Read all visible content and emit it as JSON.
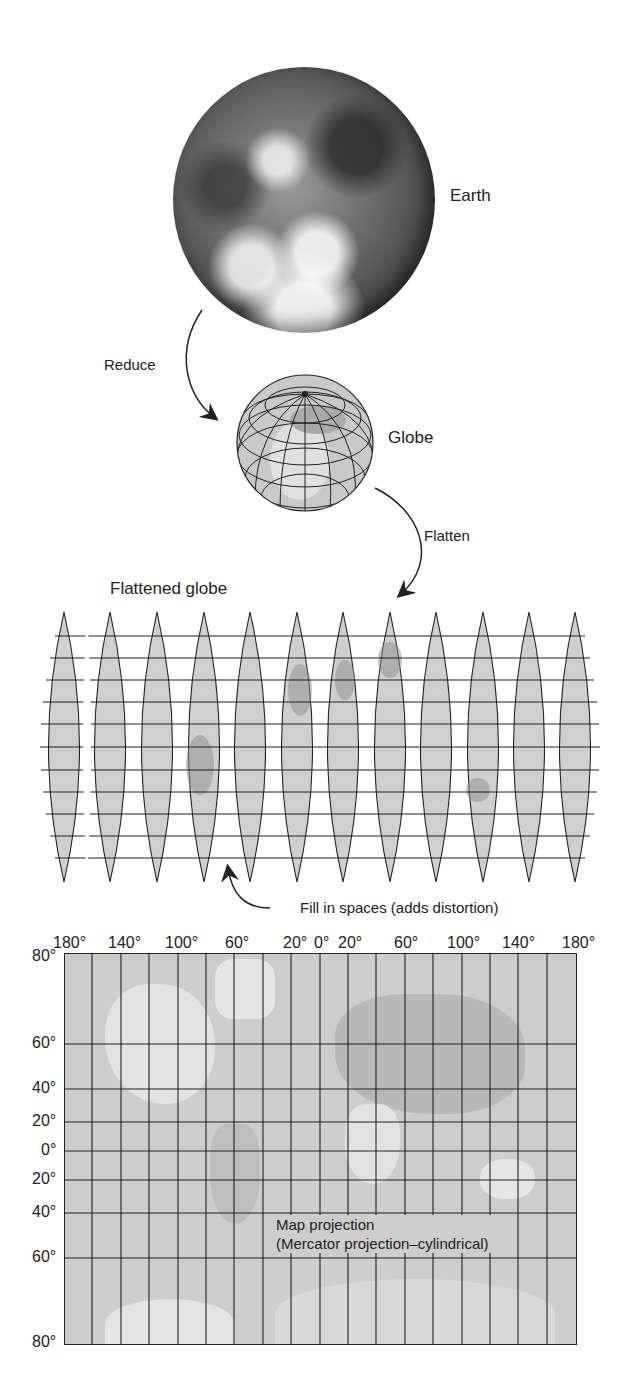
{
  "figure": {
    "earth_label": "Earth",
    "reduce_label": "Reduce",
    "globe_label": "Globe",
    "flatten_label": "Flatten",
    "flattened_globe_label": "Flattened globe",
    "fill_label": "Fill in spaces (adds distortion)",
    "gore_count": 12,
    "map": {
      "title_line1": "Map projection",
      "title_line2": "(Mercator projection–cylindrical)",
      "longitude_labels": [
        "180°",
        "140°",
        "100°",
        "60°",
        "20°",
        "0°",
        "20°",
        "60°",
        "100°",
        "140°",
        "180°"
      ],
      "latitude_labels": [
        "80°",
        "60°",
        "40°",
        "20°",
        "0°",
        "20°",
        "40°",
        "60°",
        "80°"
      ]
    }
  },
  "colors": {
    "land_gray": "#d2d2d2",
    "line": "#222222",
    "ocean": "#c8c8c8"
  }
}
